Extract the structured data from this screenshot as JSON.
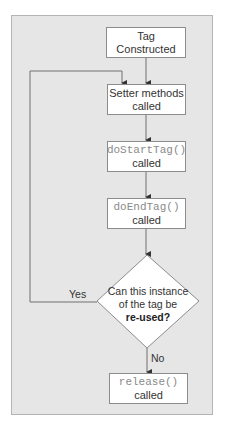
{
  "diagram": {
    "type": "flowchart",
    "nodes": [
      {
        "id": "tag-constructed",
        "line1": "Tag Constructed",
        "line1_style": "plain",
        "line2": ""
      },
      {
        "id": "setter-methods",
        "line1": "Setter methods",
        "line1_style": "plain",
        "line2": "called"
      },
      {
        "id": "do-start-tag",
        "line1": "doStartTag()",
        "line1_style": "code",
        "line2": "called"
      },
      {
        "id": "do-end-tag",
        "line1": "doEndTag()",
        "line1_style": "code",
        "line2": "called"
      },
      {
        "id": "release",
        "line1": "release()",
        "line1_style": "code",
        "line2": "called"
      }
    ],
    "decision": {
      "id": "reuse-decision",
      "line1": "Can this instance",
      "line2": "of the tag be",
      "line3_bold": "re-used?"
    },
    "edge_labels": {
      "yes": "Yes",
      "no": "No"
    },
    "edges": [
      {
        "from": "tag-constructed",
        "to": "setter-methods"
      },
      {
        "from": "setter-methods",
        "to": "do-start-tag"
      },
      {
        "from": "do-start-tag",
        "to": "do-end-tag"
      },
      {
        "from": "do-end-tag",
        "to": "reuse-decision"
      },
      {
        "from": "reuse-decision",
        "to": "setter-methods",
        "label": "Yes"
      },
      {
        "from": "reuse-decision",
        "to": "release",
        "label": "No"
      }
    ]
  },
  "colors": {
    "frame_bg": "#e6e6e6",
    "frame_border": "#b4b4b4",
    "box_border": "#8c8c8c",
    "line": "#707070",
    "arrow": "#333333",
    "code_text": "#8a8a8a",
    "text": "#333333"
  }
}
